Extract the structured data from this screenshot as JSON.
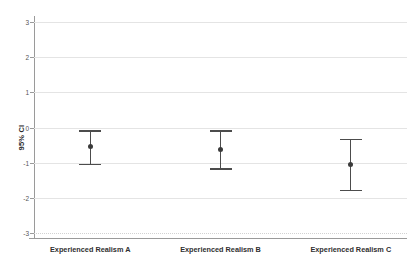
{
  "chart_data": {
    "type": "scatter",
    "title": "",
    "subtitle": "",
    "xlabel": "",
    "ylabel": "95% CI",
    "ylim": [
      -3,
      3
    ],
    "yticks": [
      3,
      2,
      1,
      0,
      -1,
      -2,
      -3
    ],
    "ytick_labels": [
      "3",
      "2",
      "1",
      "0",
      "-1",
      "-2",
      "-3"
    ],
    "grid": true,
    "legend": null,
    "legend_position": "none",
    "categories": [
      "Experienced Realism A",
      "Experienced Realism B",
      "Experienced Realism C"
    ],
    "series": [
      {
        "name": "Mean with 95% CI",
        "values": [
          -0.55,
          -0.62,
          -1.05
        ],
        "ci_upper": [
          -0.08,
          -0.08,
          -0.33
        ],
        "ci_lower": [
          -1.03,
          -1.16,
          -1.77
        ]
      }
    ],
    "points": [
      {
        "category": "Experienced Realism A",
        "mean": -0.55,
        "ci_upper": -0.08,
        "ci_lower": -1.03
      },
      {
        "category": "Experienced Realism B",
        "mean": -0.62,
        "ci_upper": -0.08,
        "ci_lower": -1.16
      },
      {
        "category": "Experienced Realism C",
        "mean": -1.05,
        "ci_upper": -0.33,
        "ci_lower": -1.77
      }
    ],
    "colors": {
      "marker": "#3a3a3a",
      "errorbar": "#4c4c4c",
      "gridline": "#e4e4e4",
      "axis": "#9a9a9a",
      "background": "#ffffff",
      "text": "#2f2f2f"
    }
  }
}
